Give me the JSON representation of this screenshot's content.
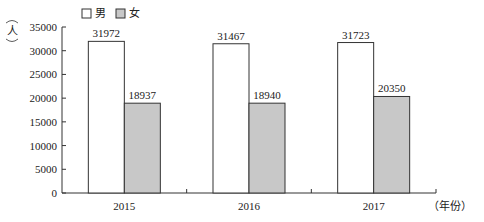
{
  "chart_data": {
    "type": "bar",
    "title": "",
    "xlabel": "（年份）",
    "ylabel": "人",
    "categories": [
      "2015",
      "2016",
      "2017"
    ],
    "series": [
      {
        "name": "男",
        "values": [
          31972,
          31467,
          31723
        ],
        "fill": "#ffffff"
      },
      {
        "name": "女",
        "values": [
          18937,
          18940,
          20350
        ],
        "fill": "#c8c8c8"
      }
    ],
    "ylim": [
      0,
      35000
    ],
    "yticks": [
      0,
      5000,
      10000,
      15000,
      20000,
      25000,
      30000,
      35000
    ],
    "grid": false,
    "legend_position": "top"
  },
  "legend": {
    "items": [
      {
        "label": "男",
        "fill": "#ffffff"
      },
      {
        "label": "女",
        "fill": "#c8c8c8"
      }
    ]
  },
  "axis": {
    "y_unit": "人",
    "x_unit": "（年份）"
  },
  "colors": {
    "stroke": "#333333",
    "female_fill": "#c8c8c8",
    "male_fill": "#ffffff"
  }
}
